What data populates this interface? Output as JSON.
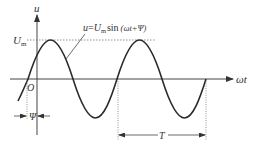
{
  "diagram": {
    "colors": {
      "ink": "#333333",
      "curve": "#2a2a2a",
      "dotted": "#777777",
      "background": "#ffffff"
    },
    "axes": {
      "y_label": "u",
      "x_label": "ωt",
      "origin_label": "O"
    },
    "amplitude_label": {
      "main": "U",
      "sub": "m"
    },
    "equation": {
      "lhs": "u",
      "eq": "=",
      "U": "U",
      "U_sub": "m",
      "func": "sin",
      "arg": "(ωt+Ψ)"
    },
    "phase_label": "Ψ",
    "period_label": "T"
  }
}
